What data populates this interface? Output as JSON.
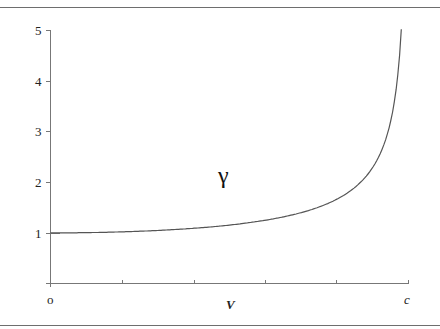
{
  "chart_data": {
    "type": "line",
    "title": "",
    "annotation": "γ",
    "xlabel": "V",
    "ylabel": "",
    "x_tick_labels": [
      "o",
      "",
      "",
      "",
      "",
      "c"
    ],
    "y_tick_labels": [
      "1",
      "2",
      "3",
      "4",
      "5"
    ],
    "xlim": [
      0,
      1
    ],
    "ylim": [
      0,
      5
    ],
    "grid": false,
    "legend": null,
    "series": [
      {
        "name": "γ",
        "formula": "1/sqrt(1-(v/c)^2)",
        "x": [
          0,
          0.1,
          0.2,
          0.3,
          0.4,
          0.5,
          0.6,
          0.7,
          0.8,
          0.85,
          0.9,
          0.93,
          0.95,
          0.96,
          0.97,
          0.98
        ],
        "values": [
          1.0,
          1.005,
          1.021,
          1.048,
          1.091,
          1.155,
          1.25,
          1.4,
          1.667,
          1.898,
          2.294,
          2.72,
          3.203,
          3.571,
          4.113,
          5.0
        ]
      }
    ],
    "color": "#555555"
  },
  "labels": {
    "y5": "5",
    "y4": "4",
    "y3": "3",
    "y2": "2",
    "y1": "1",
    "x_origin": "o",
    "x_end": "c",
    "x_axis": "V",
    "gamma": "γ"
  }
}
